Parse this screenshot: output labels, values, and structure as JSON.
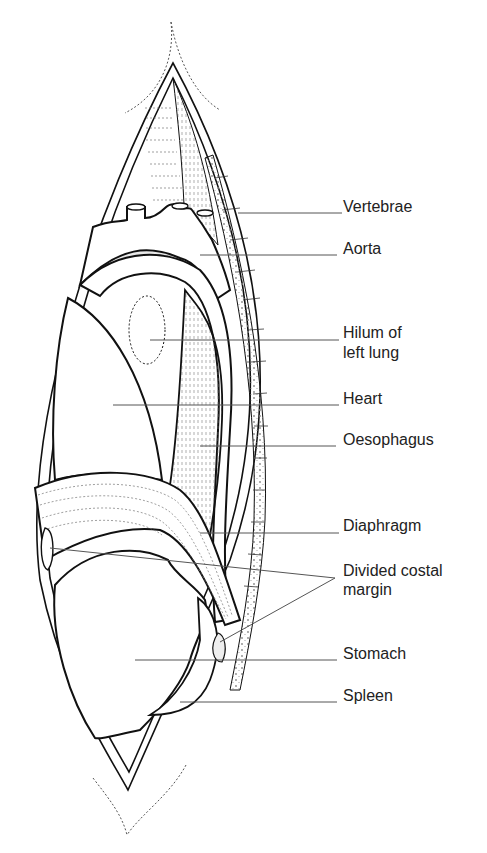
{
  "diagram": {
    "type": "anatomical-illustration",
    "labels": [
      {
        "id": "vertebrae",
        "text": "Vertebrae"
      },
      {
        "id": "aorta",
        "text": "Aorta"
      },
      {
        "id": "hilum",
        "text": "Hilum of",
        "text2": "left lung"
      },
      {
        "id": "heart",
        "text": "Heart"
      },
      {
        "id": "oesophagus",
        "text": "Oesophagus"
      },
      {
        "id": "diaphragm",
        "text": "Diaphragm"
      },
      {
        "id": "costal",
        "text": "Divided costal",
        "text2": "margin"
      },
      {
        "id": "stomach",
        "text": "Stomach"
      },
      {
        "id": "spleen",
        "text": "Spleen"
      }
    ],
    "colors": {
      "outline": "#111111",
      "leader": "#555555",
      "shade": "#e6e6e6",
      "background": "#ffffff"
    }
  }
}
